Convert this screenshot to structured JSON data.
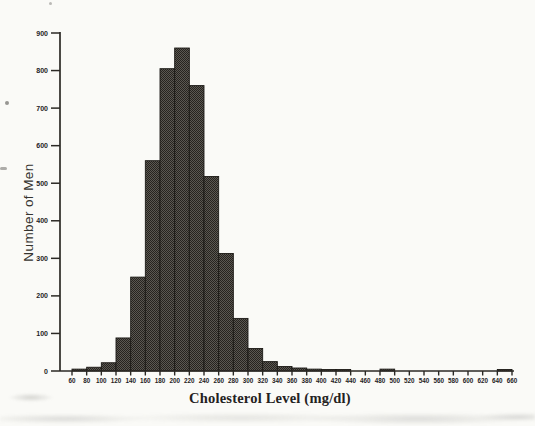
{
  "figure": {
    "x_axis_title": "Cholesterol Level (mg/dl)",
    "y_axis_title": "Number of Men"
  },
  "chart_data": {
    "type": "bar",
    "subtype": "histogram",
    "title": "",
    "xlabel": "Cholesterol Level (mg/dl)",
    "ylabel": "Number of Men",
    "bin_width": 20,
    "bin_starts": [
      60,
      80,
      100,
      120,
      140,
      160,
      180,
      200,
      220,
      240,
      260,
      280,
      300,
      320,
      340,
      360,
      380,
      400,
      420,
      440,
      460,
      480,
      500,
      520,
      540,
      560,
      580,
      600,
      620,
      640
    ],
    "values": [
      5,
      10,
      22,
      88,
      250,
      560,
      805,
      860,
      760,
      518,
      313,
      140,
      60,
      25,
      12,
      8,
      5,
      4,
      4,
      0,
      0,
      5,
      0,
      0,
      0,
      0,
      0,
      0,
      0,
      4
    ],
    "x_tick_labels": [
      60,
      80,
      100,
      120,
      140,
      160,
      180,
      200,
      220,
      240,
      260,
      280,
      300,
      320,
      340,
      360,
      380,
      400,
      420,
      440,
      460,
      480,
      500,
      520,
      540,
      560,
      580,
      600,
      620,
      640,
      660
    ],
    "y_tick_labels": [
      0,
      100,
      200,
      300,
      400,
      500,
      600,
      700,
      800,
      900
    ],
    "xlim": [
      44,
      664
    ],
    "ylim": [
      0,
      900
    ],
    "grid": false,
    "legend": null,
    "colors": {
      "bar_fill_light": "#5b5852",
      "bar_fill_dark": "#26231f",
      "bar_border": "#1c1a16",
      "axis_ink": "#2b2925",
      "label_ink": "#24221e",
      "paper": "#fafaf7"
    }
  }
}
